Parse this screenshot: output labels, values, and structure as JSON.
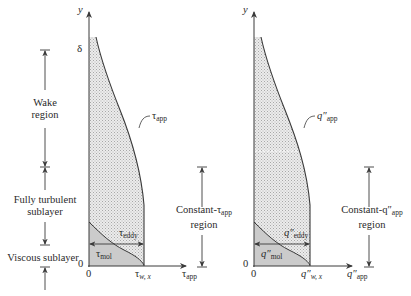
{
  "left_plot": {
    "y_axis_label": "y",
    "delta_label": "δ",
    "origin_y": "0",
    "origin_x": "0",
    "x_axis_label": {
      "base": "τ",
      "sub": "app"
    },
    "wall_value_label": {
      "base": "τ",
      "sub": "w, x"
    },
    "curve_label": {
      "base": "τ",
      "sub": "app"
    },
    "eddy_label": {
      "base": "τ",
      "sub": "eddy"
    },
    "mol_label": {
      "base": "τ",
      "sub": "mol"
    },
    "constant_region": {
      "line1_prefix": "Constant-τ",
      "line1_sub": "app",
      "line2": "region"
    }
  },
  "right_plot": {
    "y_axis_label": "y",
    "origin_y": "0",
    "origin_x": "0",
    "x_axis_label": {
      "base": "q″",
      "sub": "app"
    },
    "wall_value_label": {
      "base": "q″",
      "sub": "w, x"
    },
    "curve_label": {
      "base": "q″",
      "sub": "app"
    },
    "eddy_label": {
      "base": "q″",
      "sub": "eddy"
    },
    "mol_label": {
      "base": "q″",
      "sub": "mol"
    },
    "constant_region": {
      "line1_prefix": "Constant-q″",
      "line1_sub": "app",
      "line2": "region"
    }
  },
  "regions": {
    "wake": {
      "line1": "Wake",
      "line2": "region"
    },
    "turbulent": {
      "line1": "Fully turbulent",
      "line2": "sublayer"
    },
    "viscous": {
      "line1": "Viscous sublayer"
    }
  },
  "colors": {
    "line": "#3a3a3a",
    "dotted_fill": "#d9d9d9",
    "mol_fill": "#cfcfcf"
  }
}
